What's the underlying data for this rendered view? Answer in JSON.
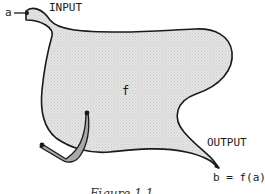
{
  "diagram": {
    "input_variable": "a",
    "input_label": "INPUT",
    "function_label": "f",
    "output_label": "OUTPUT",
    "output_expression": "b = f(a)",
    "caption": "Figure 1.1"
  },
  "colors": {
    "blob_fill": "#dcdcdc",
    "outline": "#1a1a1a",
    "crank_fill": "#a8a8a8"
  }
}
